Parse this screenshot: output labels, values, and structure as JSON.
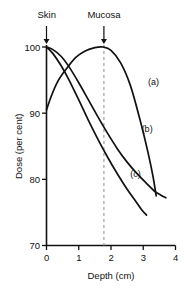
{
  "figure": {
    "annotations": [
      {
        "name": "skin-marker-label",
        "text": "Skin",
        "x_cm": 0.0
      },
      {
        "name": "mucosa-marker-label",
        "text": "Mucosa",
        "x_cm": 1.78
      }
    ],
    "guide_line": {
      "name": "mucosa-guide-line",
      "x_cm": 1.78,
      "style": "dashed"
    },
    "curve_labels": [
      {
        "name": "curve-label-a",
        "text": "(a)"
      },
      {
        "name": "curve-label-b",
        "text": "(b)"
      },
      {
        "name": "curve-label-c",
        "text": "(c)"
      }
    ],
    "caption": "",
    "ink_color": "#111111",
    "guide_color": "#999999"
  },
  "chart_data": {
    "type": "line",
    "title": "",
    "xlabel": "Depth (cm)",
    "ylabel": "Dose (per cent)",
    "xlim": [
      0,
      4
    ],
    "ylim": [
      70,
      100
    ],
    "xticks": [
      0,
      1,
      2,
      3,
      4
    ],
    "yticks": [
      70,
      80,
      90,
      100
    ],
    "xtick_labels": [
      "0",
      "1",
      "2",
      "3",
      "4"
    ],
    "ytick_labels": [
      "70",
      "80",
      "90",
      "100"
    ],
    "grid": false,
    "legend": "inline-curve-labels",
    "markers": {
      "skin_depth_cm": 0.0,
      "mucosa_depth_cm": 1.78
    },
    "series": [
      {
        "name": "(a)",
        "label": "(a)",
        "label_x_cm": 3.15,
        "label_y_pct": 94.5,
        "x": [
          0.0,
          0.15,
          0.35,
          0.6,
          0.9,
          1.2,
          1.5,
          1.75,
          2.0,
          2.3,
          2.6,
          2.9,
          3.15,
          3.3,
          3.4
        ],
        "y": [
          90.5,
          92.6,
          94.8,
          96.6,
          98.4,
          99.4,
          99.9,
          100.0,
          99.5,
          97.6,
          94.2,
          89.0,
          84.0,
          80.5,
          77.5
        ]
      },
      {
        "name": "(b)",
        "label": "(b)",
        "label_x_cm": 2.95,
        "label_y_pct": 87.5,
        "x": [
          0.0,
          0.2,
          0.45,
          0.7,
          1.0,
          1.3,
          1.6,
          1.9,
          2.2,
          2.5,
          2.8,
          3.1,
          3.35,
          3.55,
          3.7
        ],
        "y": [
          100.0,
          99.6,
          98.6,
          97.0,
          94.6,
          92.0,
          89.4,
          86.9,
          84.6,
          82.6,
          80.9,
          79.4,
          78.2,
          77.6,
          77.2
        ]
      },
      {
        "name": "(c)",
        "label": "(c)",
        "label_x_cm": 2.6,
        "label_y_pct": 80.6,
        "x": [
          0.0,
          0.2,
          0.45,
          0.7,
          1.0,
          1.3,
          1.6,
          1.9,
          2.2,
          2.5,
          2.75,
          2.95,
          3.1
        ],
        "y": [
          100.0,
          99.0,
          97.2,
          95.0,
          92.0,
          88.9,
          86.0,
          83.3,
          80.8,
          78.5,
          76.8,
          75.4,
          74.6
        ]
      }
    ]
  }
}
